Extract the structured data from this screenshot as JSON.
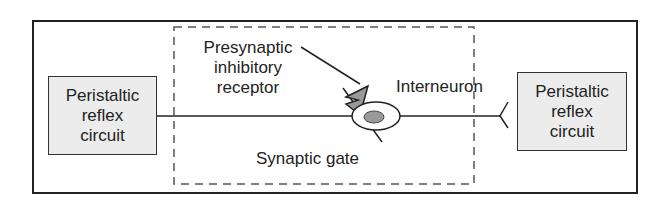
{
  "diagram": {
    "left_box": {
      "line1": "Peristaltic",
      "line2": "reflex",
      "line3": "circuit"
    },
    "right_box": {
      "line1": "Peristaltic",
      "line2": "reflex",
      "line3": "circuit"
    },
    "presynaptic_label": {
      "line1": "Presynaptic",
      "line2": "inhibitory",
      "line3": "receptor"
    },
    "interneuron_label": "Interneuron",
    "gate_label": "Synaptic gate",
    "colors": {
      "box_fill": "#ececec",
      "receptor_fill": "#999999",
      "nucleus_fill": "#999999",
      "stroke": "#222222"
    }
  }
}
